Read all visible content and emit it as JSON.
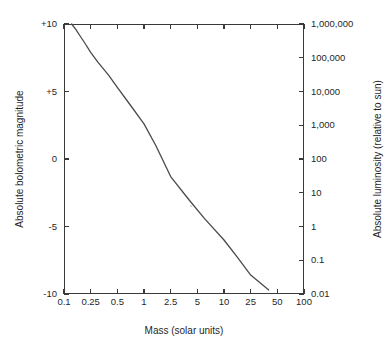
{
  "chart_data": {
    "type": "line",
    "title": "",
    "xlabel": "Mass (solar units)",
    "ylabel": "Absolute bolometric magnitude",
    "ylabel_right": "Absolute luminosity (relative to sun)",
    "grid": false,
    "legend": "none",
    "x_ticks": [
      "0.1",
      "0.25",
      "0.5",
      "1",
      "2.5",
      "5",
      "10",
      "25",
      "50",
      "100"
    ],
    "x_tick_values": [
      0.1,
      0.25,
      0.5,
      1,
      2.5,
      5,
      10,
      25,
      50,
      100
    ],
    "y_ticks_left": [
      "-10",
      "-5",
      "0",
      "+5",
      "+10"
    ],
    "y_tick_values_left": [
      -10,
      -5,
      0,
      5,
      10
    ],
    "ylim_left": [
      10,
      -10
    ],
    "y_ticks_right": [
      "1,000,000",
      "100,000",
      "10,000",
      "1,000",
      "100",
      "10",
      "1",
      "0.1",
      "0.01"
    ],
    "y_tick_values_right": [
      1000000,
      100000,
      10000,
      1000,
      100,
      10,
      1,
      0.1,
      0.01
    ],
    "ylim_right": [
      0.01,
      1000000
    ],
    "series": [
      {
        "name": "mass-luminosity relation",
        "color": "#4a4a4a",
        "x": [
          0.13,
          0.15,
          0.18,
          0.21,
          0.25,
          0.3,
          0.4,
          0.5,
          0.7,
          1.0,
          1.5,
          2.5,
          4,
          6,
          10,
          16,
          25,
          40
        ],
        "magnitude": [
          10.0,
          9.6,
          9.0,
          8.5,
          7.9,
          7.2,
          6.2,
          5.3,
          4.0,
          2.6,
          1.0,
          -1.3,
          -3.0,
          -4.4,
          -6.0,
          -7.3,
          -8.6,
          -9.7
        ],
        "luminosity": [
          0.01,
          0.014,
          0.025,
          0.04,
          0.065,
          0.12,
          0.3,
          0.7,
          2.3,
          8.0,
          35,
          290,
          1400,
          5000,
          21000,
          70000,
          230000,
          600000
        ]
      }
    ],
    "annotations": []
  },
  "colors": {
    "curve": "#4a4a4a",
    "axis": "#3a3a3a",
    "text": "#1f1f1f",
    "background": "#ffffff"
  }
}
